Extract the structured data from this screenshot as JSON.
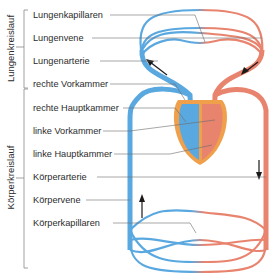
{
  "sections": {
    "pulmonary": "Lungenkreislauf",
    "systemic": "Körperkreislauf"
  },
  "labels": [
    {
      "id": "lungenkapillaren",
      "text": "Lungenkapillaren",
      "y": 15
    },
    {
      "id": "lungenvene",
      "text": "Lungenvene",
      "y": 38
    },
    {
      "id": "lungenarterie",
      "text": "Lungenarterie",
      "y": 61
    },
    {
      "id": "rechte-vorkammer",
      "text": "rechte Vorkammer",
      "y": 84
    },
    {
      "id": "rechte-hauptkammer",
      "text": "rechte Hauptkammer",
      "y": 108
    },
    {
      "id": "linke-vorkammer",
      "text": "linke Vorkammer",
      "y": 131
    },
    {
      "id": "linke-hauptkammer",
      "text": "linke Hauptkammer",
      "y": 154
    },
    {
      "id": "koerperarterie",
      "text": "Körperarterie",
      "y": 177
    },
    {
      "id": "koerpervene",
      "text": "Körpervene",
      "y": 200
    },
    {
      "id": "koerperkapillaren",
      "text": "Körperkapillaren",
      "y": 223
    }
  ],
  "colors": {
    "deoxygenated": "#5aa8e0",
    "oxygenated": "#e8836e",
    "heart_wall": "#f0a04a",
    "leader": "#6b6b6b",
    "arrow": "#1a1a1a"
  }
}
